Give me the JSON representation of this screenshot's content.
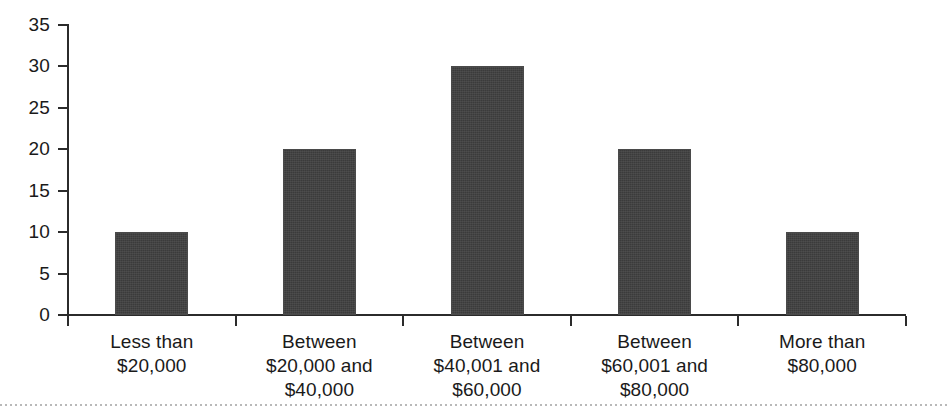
{
  "chart_data": {
    "type": "bar",
    "title": "",
    "subtitle": "",
    "xlabel": "",
    "ylabel": "",
    "categories": [
      "Less than $20,000",
      "Between $20,000 and $40,000",
      "Between $40,001 and $60,000",
      "Between $60,001 and $80,000",
      "More than $80,000"
    ],
    "category_lines": [
      [
        "Less than",
        "$20,000"
      ],
      [
        "Between",
        "$20,000 and",
        "$40,000"
      ],
      [
        "Between",
        "$40,001 and",
        "$60,000"
      ],
      [
        "Between",
        "$60,001 and",
        "$80,000"
      ],
      [
        "More than",
        "$80,000"
      ]
    ],
    "values": [
      10,
      20,
      30,
      20,
      10
    ],
    "ylim": [
      0,
      35
    ],
    "ytick_values": [
      0,
      5,
      10,
      15,
      20,
      25,
      30,
      35
    ],
    "ytick_labels": [
      "0",
      "5",
      "10",
      "15",
      "20",
      "25",
      "30",
      "35"
    ],
    "grid": false,
    "legend": false,
    "legend_position": "none",
    "bar_color": "#3b3b3b",
    "axis_color": "#2b2b2b",
    "background_color": "#ffffff"
  }
}
